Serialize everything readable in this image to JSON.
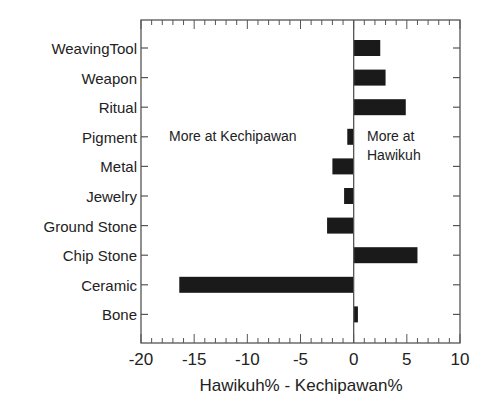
{
  "chart_data": {
    "type": "bar",
    "orientation": "horizontal",
    "title": "",
    "xlabel": "Hawikuh% - Kechipawan%",
    "ylabel": "",
    "xlim": [
      -20,
      10
    ],
    "xticks": [
      -20,
      -15,
      -10,
      -5,
      0,
      5,
      10
    ],
    "xtick_labels": [
      "-20",
      "-15",
      "-10",
      "-5",
      "0",
      "5",
      "10"
    ],
    "minor_tick_step": 1,
    "grid": false,
    "legend": null,
    "categories": [
      "WeavingTool",
      "Weapon",
      "Ritual",
      "Pigment",
      "Metal",
      "Jewelry",
      "Ground Stone",
      "Chip Stone",
      "Ceramic",
      "Bone"
    ],
    "values": [
      2.5,
      3.0,
      4.9,
      -0.6,
      -2.0,
      -0.9,
      -2.5,
      6.0,
      -16.4,
      0.4
    ],
    "bar_color": "#1a1a1a",
    "annotations": [
      {
        "text": "More at Kechipawan",
        "x": -13.3,
        "y_category": "Pigment"
      },
      {
        "text": "More at",
        "line2": "Hawikuh",
        "x": 1.2,
        "y_category": "Pigment"
      }
    ]
  },
  "labels": {
    "xlabel": "Hawikuh% - Kechipawan%",
    "annot_left": "More at Kechipawan",
    "annot_right_1": "More at",
    "annot_right_2": "Hawikuh"
  }
}
